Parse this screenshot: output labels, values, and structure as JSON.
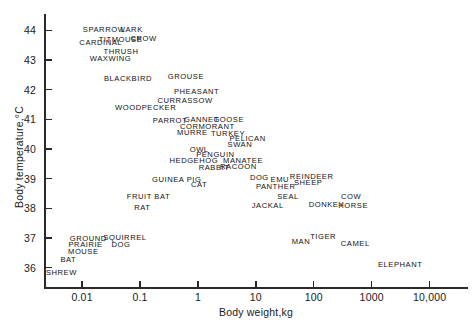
{
  "chart_data": {
    "type": "scatter",
    "title": "",
    "xlabel": "Body weight,kg",
    "ylabel": "Body temperature,°C",
    "xscale": "log",
    "yscale": "linear",
    "xlim": [
      0.0022,
      46000
    ],
    "ylim": [
      35.35,
      44.55
    ],
    "grid": false,
    "legend": null,
    "marker_style": "text-label",
    "note": "Each data point is rendered as the animal's name rather than a symbol.",
    "xticks": [
      "0.01",
      "0.1",
      "1",
      "10",
      "100",
      "1000",
      "10,000"
    ],
    "xtick_values": [
      0.01,
      0.1,
      1,
      10,
      100,
      1000,
      10000
    ],
    "yticks": [
      "36",
      "37",
      "38",
      "39",
      "40",
      "41",
      "42",
      "43",
      "44"
    ],
    "ytick_values": [
      36,
      37,
      38,
      39,
      40,
      41,
      42,
      43,
      44
    ],
    "points": [
      {
        "label": "SPARROW",
        "x": 0.024,
        "y": 44.05
      },
      {
        "label": "LARK",
        "x": 0.072,
        "y": 44.05
      },
      {
        "label": "TITMOUSE",
        "x": 0.046,
        "y": 43.72
      },
      {
        "label": "CROW",
        "x": 0.115,
        "y": 43.75
      },
      {
        "label": "CARDINAL",
        "x": 0.021,
        "y": 43.6
      },
      {
        "label": "THRUSH",
        "x": 0.047,
        "y": 43.3
      },
      {
        "label": "WAXWING",
        "x": 0.031,
        "y": 43.08
      },
      {
        "label": "BLACKBIRD",
        "x": 0.062,
        "y": 42.38
      },
      {
        "label": "GROUSE",
        "x": 0.62,
        "y": 42.45
      },
      {
        "label": "PHEASANT",
        "x": 0.95,
        "y": 41.95
      },
      {
        "label": "CURRASSOW",
        "x": 0.6,
        "y": 41.66
      },
      {
        "label": "WOODPECKER",
        "x": 0.125,
        "y": 41.4
      },
      {
        "label": "PARROT",
        "x": 0.33,
        "y": 40.98
      },
      {
        "label": "GANNET",
        "x": 1.15,
        "y": 41.0
      },
      {
        "label": "GOOSE",
        "x": 3.4,
        "y": 41.0
      },
      {
        "label": "CORMORANT",
        "x": 1.45,
        "y": 40.78
      },
      {
        "label": "MURRE",
        "x": 0.8,
        "y": 40.56
      },
      {
        "label": "TURKEY",
        "x": 3.3,
        "y": 40.55
      },
      {
        "label": "PELICAN",
        "x": 7.2,
        "y": 40.38
      },
      {
        "label": "SWAN",
        "x": 5.3,
        "y": 40.18
      },
      {
        "label": "OWL",
        "x": 1.05,
        "y": 40.0
      },
      {
        "label": "PENGUIN",
        "x": 2.0,
        "y": 39.82
      },
      {
        "label": "HEDGEHOG",
        "x": 0.85,
        "y": 39.62
      },
      {
        "label": "MANATEE",
        "x": 6.0,
        "y": 39.62
      },
      {
        "label": "RABBIT",
        "x": 1.9,
        "y": 39.4
      },
      {
        "label": "RACOON",
        "x": 5.0,
        "y": 39.42
      },
      {
        "label": "GUINEA PIG",
        "x": 0.43,
        "y": 39.0
      },
      {
        "label": "DOG",
        "x": 11.5,
        "y": 39.05
      },
      {
        "label": "EMU",
        "x": 26,
        "y": 39.0
      },
      {
        "label": "REINDEER",
        "x": 92,
        "y": 39.08
      },
      {
        "label": "SHEEP",
        "x": 80,
        "y": 38.88
      },
      {
        "label": "CAT",
        "x": 1.05,
        "y": 38.82
      },
      {
        "label": "PANTHER",
        "x": 22,
        "y": 38.75
      },
      {
        "label": "FRUIT BAT",
        "x": 0.14,
        "y": 38.4
      },
      {
        "label": "SEAL",
        "x": 36,
        "y": 38.42
      },
      {
        "label": "COW",
        "x": 440,
        "y": 38.4
      },
      {
        "label": "RAT",
        "x": 0.11,
        "y": 38.05
      },
      {
        "label": "JACKAL",
        "x": 16,
        "y": 38.12
      },
      {
        "label": "DONKEY",
        "x": 165,
        "y": 38.15
      },
      {
        "label": "HORSE",
        "x": 480,
        "y": 38.12
      },
      {
        "label": "GROUND",
        "x": 0.0128,
        "y": 37.0
      },
      {
        "label": "SQUIRREL",
        "x": 0.055,
        "y": 37.02
      },
      {
        "label": "PRAIRIE",
        "x": 0.0115,
        "y": 36.8
      },
      {
        "label": "DOG",
        "x": 0.047,
        "y": 36.8
      },
      {
        "label": "MAN",
        "x": 60,
        "y": 36.9
      },
      {
        "label": "TIGER",
        "x": 145,
        "y": 37.08
      },
      {
        "label": "CAMEL",
        "x": 520,
        "y": 36.82
      },
      {
        "label": "MOUSE",
        "x": 0.0105,
        "y": 36.58
      },
      {
        "label": "BAT",
        "x": 0.0058,
        "y": 36.3
      },
      {
        "label": "ELEPHANT",
        "x": 3100,
        "y": 36.12
      },
      {
        "label": "SHREW",
        "x": 0.0044,
        "y": 35.85
      }
    ]
  }
}
